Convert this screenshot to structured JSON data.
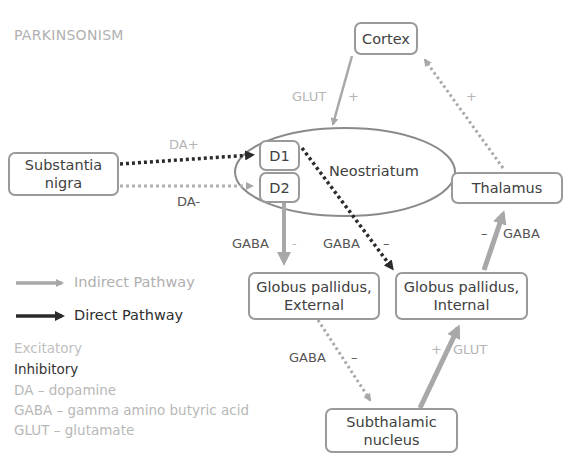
{
  "title": "PARKINSONISM",
  "nodes": {
    "cortex": "Cortex",
    "substantia_nigra": [
      "Substantia",
      "nigra"
    ],
    "neostriatum": "Neostriatum",
    "d1": "D1",
    "d2": "D2",
    "thalamus": "Thalamus",
    "gp_external": [
      "Globus pallidus,",
      "External"
    ],
    "gp_internal": [
      "Globus pallidus,",
      "Internal"
    ],
    "subthalamic": [
      "Subthalamic",
      "nucleus"
    ]
  },
  "edge_labels": {
    "cortex_to_striatum": {
      "transmitter": "GLUT",
      "sign": "+"
    },
    "thalamus_to_cortex": {
      "sign": "+"
    },
    "sn_to_d1": {
      "transmitter": "DA+"
    },
    "sn_to_d2": {
      "transmitter": "DA-"
    },
    "d2_to_gpe": {
      "transmitter": "GABA",
      "sign": "-"
    },
    "d1_to_gpi": {
      "transmitter": "GABA",
      "sign": "–"
    },
    "gpi_to_thalamus": {
      "transmitter": "GABA",
      "sign": "–"
    },
    "gpe_to_stn": {
      "transmitter": "GABA",
      "sign": "–"
    },
    "stn_to_gpi": {
      "transmitter": "GLUT",
      "sign": "+"
    }
  },
  "legend": {
    "indirect": "Indirect Pathway",
    "direct": "Direct Pathway",
    "excitatory": "Excitatory",
    "inhibitory": "Inhibitory",
    "abbreviations": [
      "DA – dopamine",
      "GABA – gamma amino butyric acid",
      "GLUT – glutamate"
    ]
  },
  "colors": {
    "indirect": "#a8a8a8",
    "direct": "#2b2b2b",
    "excitatory_text": "#b8b8b8",
    "inhibitory_text": "#333333",
    "box_border": "#9a9a9a"
  }
}
